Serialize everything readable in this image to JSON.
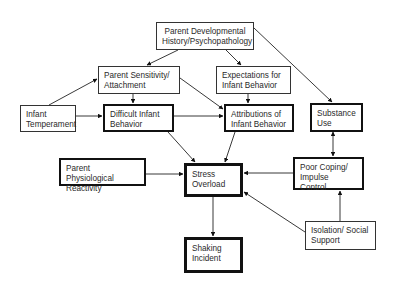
{
  "diagram": {
    "title": "",
    "nodes": [
      {
        "id": "parent_dev",
        "line1": "Parent Developmental",
        "line2": "History/Psychopathology",
        "x": 156,
        "y": 22,
        "w": 98,
        "h": 28,
        "style": "thin",
        "align": "center"
      },
      {
        "id": "parent_sens",
        "line1": "Parent Sensitivity/",
        "line2": "Attachment",
        "x": 98,
        "y": 66,
        "w": 82,
        "h": 28,
        "style": "thin",
        "align": "left"
      },
      {
        "id": "expect",
        "line1": "Expectations for",
        "line2": "Infant Behavior",
        "x": 216,
        "y": 66,
        "w": 75,
        "h": 28,
        "style": "thin",
        "align": "left"
      },
      {
        "id": "infant_temp",
        "line1": "Infant",
        "line2": "Temperament",
        "x": 20,
        "y": 105,
        "w": 56,
        "h": 27,
        "style": "thin",
        "align": "left"
      },
      {
        "id": "difficult",
        "line1": "Difficult Infant",
        "line2": "Behavior",
        "x": 103,
        "y": 104,
        "w": 71,
        "h": 28,
        "style": "thick",
        "align": "left"
      },
      {
        "id": "attrib",
        "line1": "Attributions of",
        "line2": "Infant Behavior",
        "x": 224,
        "y": 104,
        "w": 70,
        "h": 28,
        "style": "thick",
        "align": "left"
      },
      {
        "id": "substance",
        "line1": "Substance",
        "line2": "Use",
        "x": 310,
        "y": 103,
        "w": 53,
        "h": 29,
        "style": "thick",
        "align": "left"
      },
      {
        "id": "phys",
        "line1": "Parent Physiological",
        "line2": "Reactivity",
        "x": 59,
        "y": 158,
        "w": 87,
        "h": 28,
        "style": "thick",
        "align": "left"
      },
      {
        "id": "stress",
        "line1": "Stress",
        "line2": "Overload",
        "x": 184,
        "y": 163,
        "w": 59,
        "h": 34,
        "style": "thicker",
        "align": "left"
      },
      {
        "id": "coping",
        "line1": "Poor Coping/",
        "line2": "Impulse Control",
        "x": 293,
        "y": 157,
        "w": 71,
        "h": 33,
        "style": "thick",
        "align": "left"
      },
      {
        "id": "isolation",
        "line1": "Isolation/ Social",
        "line2": "Support",
        "x": 305,
        "y": 221,
        "w": 71,
        "h": 29,
        "style": "thin",
        "align": "left"
      },
      {
        "id": "shaking",
        "line1": "Shaking",
        "line2": "Incident",
        "x": 184,
        "y": 237,
        "w": 59,
        "h": 36,
        "style": "thicker",
        "align": "left"
      }
    ],
    "edges": [
      {
        "from": "parent_dev",
        "to": "parent_sens",
        "x1": 178,
        "y1": 50,
        "x2": 147,
        "y2": 65
      },
      {
        "from": "parent_dev",
        "to": "expect",
        "x1": 226,
        "y1": 50,
        "x2": 241,
        "y2": 65
      },
      {
        "from": "parent_dev",
        "to": "substance",
        "x1": 254,
        "y1": 28,
        "x2": 332,
        "y2": 102
      },
      {
        "from": "infant_temp",
        "to": "parent_sens",
        "x1": 49,
        "y1": 105,
        "x2": 97,
        "y2": 79
      },
      {
        "from": "infant_temp",
        "to": "difficult",
        "x1": 76,
        "y1": 116,
        "x2": 102,
        "y2": 116
      },
      {
        "from": "parent_sens",
        "to": "difficult",
        "x1": 133,
        "y1": 94,
        "x2": 133,
        "y2": 103
      },
      {
        "from": "parent_sens",
        "to": "attrib",
        "x1": 180,
        "y1": 78,
        "x2": 223,
        "y2": 109
      },
      {
        "from": "expect",
        "to": "attrib",
        "x1": 248,
        "y1": 94,
        "x2": 248,
        "y2": 103
      },
      {
        "from": "difficult",
        "to": "attrib",
        "x1": 174,
        "y1": 116,
        "x2": 223,
        "y2": 116
      },
      {
        "from": "difficult",
        "to": "stress",
        "x1": 168,
        "y1": 132,
        "x2": 195,
        "y2": 162
      },
      {
        "from": "attrib",
        "to": "stress",
        "x1": 235,
        "y1": 132,
        "x2": 225,
        "y2": 162
      },
      {
        "from": "phys",
        "to": "stress",
        "x1": 146,
        "y1": 174,
        "x2": 183,
        "y2": 174
      },
      {
        "from": "coping",
        "to": "stress",
        "x1": 293,
        "y1": 173,
        "x2": 244,
        "y2": 173
      },
      {
        "from": "isolation",
        "to": "stress",
        "x1": 305,
        "y1": 232,
        "x2": 244,
        "y2": 192
      },
      {
        "from": "isolation",
        "to": "coping",
        "x1": 340,
        "y1": 221,
        "x2": 340,
        "y2": 191
      },
      {
        "from": "stress",
        "to": "shaking",
        "x1": 213,
        "y1": 197,
        "x2": 213,
        "y2": 236
      },
      {
        "from": "substance",
        "to": "coping",
        "x1": 333,
        "y1": 132,
        "x2": 333,
        "y2": 156,
        "bidirectional": true
      }
    ]
  }
}
